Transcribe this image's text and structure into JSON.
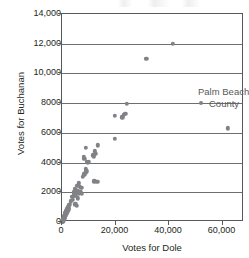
{
  "chart_data": {
    "type": "scatter",
    "title": "",
    "xlabel": "Votes for Dole",
    "ylabel": "Votes for Buchanan",
    "xlim": [
      0,
      68000
    ],
    "ylim": [
      0,
      14000
    ],
    "xticks": [
      0,
      20000,
      40000,
      60000
    ],
    "xticklabels": [
      "0",
      "20,000",
      "40,000",
      "60,000"
    ],
    "yticks": [
      0,
      2000,
      4000,
      6000,
      8000,
      10000,
      12000,
      14000
    ],
    "yticklabels": [
      "0",
      "2000",
      "4000",
      "6000",
      "8000",
      "10,000",
      "12,000",
      "14,000"
    ],
    "grid": "horizontal",
    "legend": "none",
    "marker_color": "#808285",
    "axis_color": "#58595b",
    "gridline_color": "#6d6e71",
    "annotations": [
      {
        "name": "palm-beach-county",
        "line1": "Palm Beach",
        "line2": "County",
        "x": 41500,
        "y": 12000
      }
    ],
    "points": [
      {
        "x": 41500,
        "y": 12000
      },
      {
        "x": 31500,
        "y": 11000
      },
      {
        "x": 24200,
        "y": 7950
      },
      {
        "x": 19800,
        "y": 7150
      },
      {
        "x": 22500,
        "y": 7050
      },
      {
        "x": 23200,
        "y": 7200
      },
      {
        "x": 23700,
        "y": 7300
      },
      {
        "x": 62000,
        "y": 6300
      },
      {
        "x": 19700,
        "y": 5600
      },
      {
        "x": 13300,
        "y": 5150
      },
      {
        "x": 9000,
        "y": 5000
      },
      {
        "x": 12300,
        "y": 4750
      },
      {
        "x": 12600,
        "y": 4600
      },
      {
        "x": 11700,
        "y": 4500
      },
      {
        "x": 8200,
        "y": 4400
      },
      {
        "x": 8400,
        "y": 4250
      },
      {
        "x": 11900,
        "y": 4400
      },
      {
        "x": 9200,
        "y": 4050
      },
      {
        "x": 9600,
        "y": 4000
      },
      {
        "x": 10100,
        "y": 4050
      },
      {
        "x": 8800,
        "y": 3600
      },
      {
        "x": 9100,
        "y": 3400
      },
      {
        "x": 8900,
        "y": 3300
      },
      {
        "x": 8300,
        "y": 3200
      },
      {
        "x": 7700,
        "y": 3050
      },
      {
        "x": 12000,
        "y": 2750
      },
      {
        "x": 13200,
        "y": 2700
      },
      {
        "x": 6200,
        "y": 2600
      },
      {
        "x": 5700,
        "y": 2450
      },
      {
        "x": 6600,
        "y": 2350
      },
      {
        "x": 7200,
        "y": 2300
      },
      {
        "x": 4800,
        "y": 2250
      },
      {
        "x": 5100,
        "y": 2150
      },
      {
        "x": 5900,
        "y": 2100
      },
      {
        "x": 6900,
        "y": 2050
      },
      {
        "x": 4300,
        "y": 2000
      },
      {
        "x": 5400,
        "y": 1950
      },
      {
        "x": 6300,
        "y": 1900
      },
      {
        "x": 7400,
        "y": 1900
      },
      {
        "x": 4600,
        "y": 1800
      },
      {
        "x": 5200,
        "y": 1750
      },
      {
        "x": 3800,
        "y": 1700
      },
      {
        "x": 6000,
        "y": 1600
      },
      {
        "x": 4100,
        "y": 1500
      },
      {
        "x": 3400,
        "y": 1400
      },
      {
        "x": 4900,
        "y": 1200
      },
      {
        "x": 5600,
        "y": 1100
      },
      {
        "x": 2800,
        "y": 1150
      },
      {
        "x": 2300,
        "y": 1000
      },
      {
        "x": 1900,
        "y": 900
      },
      {
        "x": 2600,
        "y": 850
      },
      {
        "x": 1600,
        "y": 750
      },
      {
        "x": 2100,
        "y": 700
      },
      {
        "x": 1300,
        "y": 620
      },
      {
        "x": 1700,
        "y": 560
      },
      {
        "x": 1000,
        "y": 480
      },
      {
        "x": 1400,
        "y": 430
      },
      {
        "x": 800,
        "y": 380
      },
      {
        "x": 1100,
        "y": 330
      },
      {
        "x": 600,
        "y": 290
      },
      {
        "x": 900,
        "y": 250
      },
      {
        "x": 450,
        "y": 200
      },
      {
        "x": 700,
        "y": 170
      },
      {
        "x": 300,
        "y": 140
      },
      {
        "x": 500,
        "y": 110
      },
      {
        "x": 200,
        "y": 90
      },
      {
        "x": 350,
        "y": 70
      },
      {
        "x": 150,
        "y": 50
      },
      {
        "x": 250,
        "y": 35
      },
      {
        "x": 100,
        "y": 25
      }
    ]
  }
}
